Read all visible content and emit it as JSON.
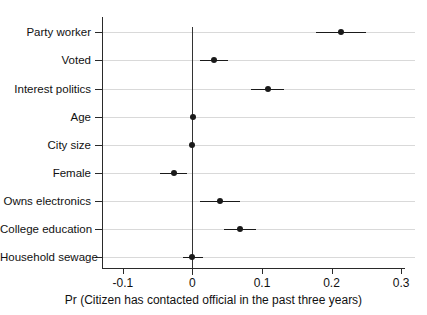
{
  "chart_data": {
    "type": "scatter",
    "subtype": "coefficient-plot-with-confidence-intervals",
    "title": "",
    "xlabel": "Pr (Citizen has contacted official in the past three years)",
    "ylabel": "",
    "xlim": [
      -0.13,
      0.32
    ],
    "ylim": [
      0,
      10
    ],
    "grid": "horizontal",
    "legend": "none",
    "reference_line_x": 0,
    "xticks": [
      -0.1,
      0,
      0.1,
      0.2,
      0.3
    ],
    "xticklabels": [
      "-0.1",
      "0",
      "0.1",
      "0.2",
      "0.3"
    ],
    "categories": [
      "Party worker",
      "Voted",
      "Interest politics",
      "Age",
      "City size",
      "Female",
      "Owns electronics",
      "College education",
      "Household sewage"
    ],
    "values": [
      0.213,
      0.031,
      0.108,
      0.001,
      0.0,
      -0.027,
      0.04,
      0.069,
      -0.001
    ],
    "ci_low": [
      0.177,
      0.011,
      0.084,
      -0.001,
      -0.004,
      -0.046,
      0.011,
      0.045,
      -0.013
    ],
    "ci_high": [
      0.25,
      0.051,
      0.132,
      0.003,
      0.002,
      -0.008,
      0.068,
      0.092,
      0.015
    ],
    "point_color": "#1a1a1a",
    "line_color": "#1a1a1a",
    "grid_color": "#d9d9d9",
    "axis_color": "#2a2a2a",
    "background": "#ffffff"
  }
}
